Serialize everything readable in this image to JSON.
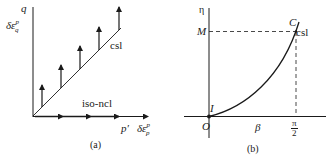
{
  "panel_a": {
    "caption": "(a)",
    "y_axis_label": "q",
    "y_axis_strain_label": {
      "base": "δε",
      "sup": "p",
      "sub": "q"
    },
    "x_axis_label": "p′",
    "x_axis_strain_label": {
      "base": "δε",
      "sup": "p",
      "sub": "p"
    },
    "line_labels": {
      "csl": "csl",
      "iso_ncl": "iso-ncl"
    },
    "vertical_arrow_count": 5,
    "horizontal_arrow_count": 4
  },
  "panel_b": {
    "caption": "(b)",
    "y_axis_label": "η",
    "x_axis_label": "β",
    "origin_label": "O",
    "start_point_label": "I",
    "end_point_label": "C",
    "y_tick_label": "M",
    "x_tick_label": {
      "num": "π",
      "den": "2"
    },
    "curve_label": "csl"
  },
  "colors": {
    "ink": "#1a1a1a",
    "background": "#ffffff"
  }
}
